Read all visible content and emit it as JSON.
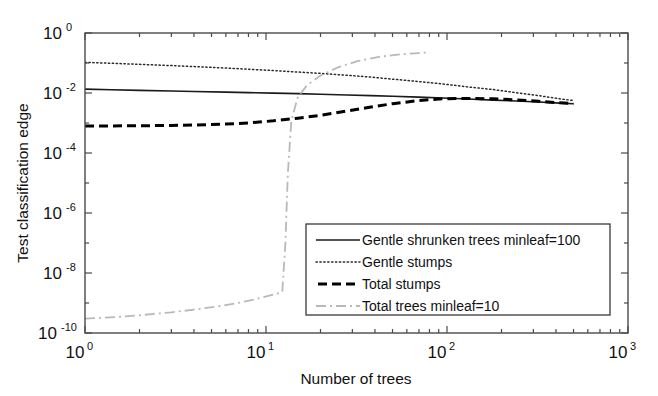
{
  "chart_data": {
    "type": "line",
    "title": "",
    "xlabel": "Number of trees",
    "ylabel": "Test classification edge",
    "xscale": "log",
    "yscale": "log",
    "xlim": [
      1,
      1000
    ],
    "ylim": [
      1e-10,
      1
    ],
    "grid": false,
    "legend_position": "lower right",
    "xticks": [
      "10^0",
      "10^1",
      "10^2",
      "10^3"
    ],
    "xtick_mantissa": [
      "10",
      "10",
      "10",
      "10"
    ],
    "xtick_exponent": [
      "0",
      "1",
      "2",
      "3"
    ],
    "yticks": [
      "10^0",
      "10^-2",
      "10^-4",
      "10^-6",
      "10^-8",
      "10^-10"
    ],
    "ytick_mantissa": [
      "10",
      "10",
      "10",
      "10",
      "10",
      "10"
    ],
    "ytick_exponent": [
      "0",
      "-2",
      "-4",
      "-6",
      "-8",
      "-10"
    ],
    "series": [
      {
        "name": "Gentle shrunken trees minleaf=100",
        "style": "solid",
        "color": "#1a1a1a",
        "width": 1.6,
        "x": [
          1,
          1.4,
          2,
          3,
          4,
          6,
          8,
          11,
          15,
          20,
          28,
          38,
          50,
          70,
          95,
          130,
          180,
          240,
          320,
          420,
          500
        ],
        "y": [
          0.0135,
          0.0128,
          0.0122,
          0.0116,
          0.0112,
          0.0107,
          0.0103,
          0.0099,
          0.0095,
          0.0091,
          0.0086,
          0.0082,
          0.0078,
          0.0073,
          0.0068,
          0.0063,
          0.0058,
          0.0054,
          0.005,
          0.0046,
          0.0044
        ]
      },
      {
        "name": "Gentle stumps",
        "style": "dotted",
        "color": "#2a2a2a",
        "width": 1.5,
        "x": [
          1,
          1.4,
          2,
          3,
          4,
          6,
          8,
          11,
          15,
          20,
          28,
          38,
          50,
          70,
          95,
          130,
          180,
          240,
          320,
          420,
          500
        ],
        "y": [
          0.105,
          0.098,
          0.09,
          0.082,
          0.076,
          0.068,
          0.062,
          0.056,
          0.05,
          0.045,
          0.039,
          0.034,
          0.029,
          0.024,
          0.02,
          0.016,
          0.013,
          0.0103,
          0.0082,
          0.0064,
          0.0056
        ]
      },
      {
        "name": "Total stumps",
        "style": "dashed",
        "color": "#000000",
        "width": 3.0,
        "x": [
          1,
          1.4,
          2,
          3,
          4,
          6,
          8,
          11,
          15,
          20,
          28,
          38,
          50,
          70,
          95,
          130,
          180,
          240,
          320,
          420,
          500
        ],
        "y": [
          0.0008,
          0.0008,
          0.00081,
          0.00083,
          0.00086,
          0.00092,
          0.00101,
          0.00118,
          0.00145,
          0.0018,
          0.0025,
          0.0034,
          0.0044,
          0.0056,
          0.0064,
          0.0066,
          0.0064,
          0.0059,
          0.0053,
          0.0047,
          0.0044
        ]
      },
      {
        "name": "Total trees minleaf=10",
        "style": "dashdot",
        "color": "#b9b9b9",
        "width": 1.8,
        "x": [
          1,
          1.5,
          2,
          3,
          4,
          5.5,
          7,
          9,
          11,
          12.3,
          12.8,
          13.2,
          13.8,
          15,
          17,
          20,
          25,
          32,
          42,
          55,
          70,
          80
        ],
        "y": [
          3e-10,
          3.4e-10,
          3.9e-10,
          4.9e-10,
          6e-10,
          7.8e-10,
          1e-09,
          1.4e-09,
          1.9e-09,
          2.3e-09,
          1e-07,
          2e-05,
          0.0012,
          0.0075,
          0.019,
          0.038,
          0.072,
          0.115,
          0.16,
          0.195,
          0.215,
          0.225
        ]
      }
    ]
  },
  "legend": {
    "items": [
      {
        "label": "Gentle shrunken trees minleaf=100",
        "style": "solid"
      },
      {
        "label": "Gentle stumps",
        "style": "dotted"
      },
      {
        "label": "Total stumps",
        "style": "dashed"
      },
      {
        "label": "Total trees minleaf=10",
        "style": "dashdot"
      }
    ]
  }
}
